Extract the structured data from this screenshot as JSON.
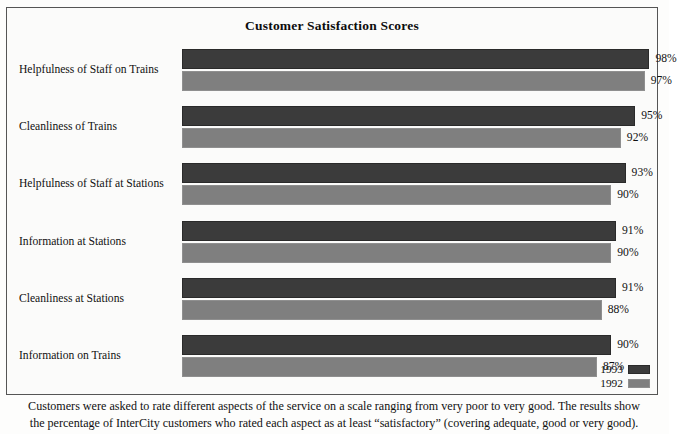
{
  "chart_data": {
    "type": "bar",
    "orientation": "horizontal",
    "title": "Customer Satisfaction Scores",
    "xlabel": "",
    "ylabel": "",
    "xlim": [
      0,
      100
    ],
    "grid": false,
    "legend_position": "bottom-right",
    "categories": [
      "Helpfulness of Staff on Trains",
      "Cleanliness of Trains",
      "Helpfulness of Staff at Stations",
      "Information at Stations",
      "Cleanliness at Stations",
      "Information on Trains"
    ],
    "series": [
      {
        "name": "1993",
        "color": "#3b3b3b",
        "values": [
          98,
          95,
          93,
          91,
          91,
          90
        ]
      },
      {
        "name": "1992",
        "color": "#7f7f7f",
        "values": [
          97,
          92,
          90,
          90,
          88,
          87
        ]
      }
    ],
    "value_labels": [
      [
        "98%",
        "97%"
      ],
      [
        "95%",
        "92%"
      ],
      [
        "93%",
        "90%"
      ],
      [
        "91%",
        "90%"
      ],
      [
        "91%",
        "88%"
      ],
      [
        "90%",
        "87%"
      ]
    ],
    "annotations": [
      "Customers were asked to rate different aspects of the service on a scale ranging from very poor to very good. The results show",
      "the percentage of InterCity customers who rated each aspect as at least “satisfactory” (covering adequate, good or very good)."
    ]
  },
  "legend": {
    "items": [
      {
        "label": "1993",
        "color": "#3b3b3b"
      },
      {
        "label": "1992",
        "color": "#7f7f7f"
      }
    ]
  },
  "caption": {
    "line1": "Customers were asked to rate different aspects of the service on a scale ranging from very poor to very good. The results show",
    "line2": "the percentage of InterCity customers who rated each aspect as at least “satisfactory” (covering adequate, good or very good)."
  }
}
